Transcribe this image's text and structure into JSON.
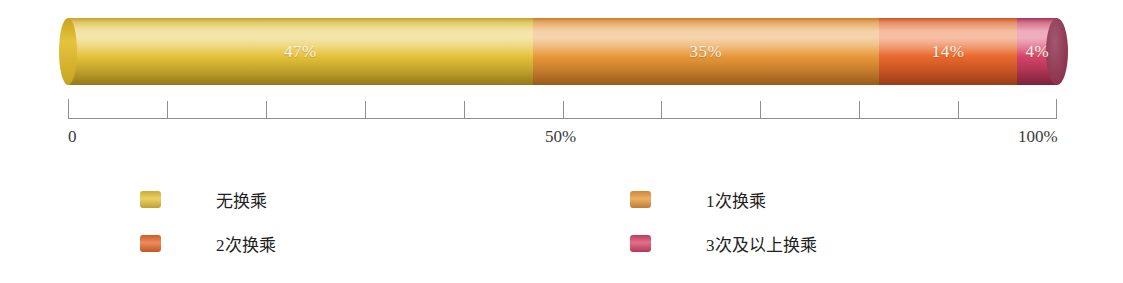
{
  "chart_data": {
    "type": "bar",
    "orientation": "horizontal",
    "stacked": true,
    "title": "",
    "xlabel": "",
    "ylabel": "",
    "xlim": [
      0,
      100
    ],
    "grid": false,
    "legend_position": "bottom",
    "categories": [
      "无换乘",
      "1次换乘",
      "2次换乘",
      "3次及以上换乘"
    ],
    "values": [
      47,
      35,
      14,
      4
    ],
    "data_labels": [
      "47%",
      "35%",
      "14%",
      "4%"
    ],
    "colors": [
      "#E5C33C",
      "#E8993C",
      "#E96A2E",
      "#D8456A"
    ],
    "series": [
      {
        "name": "无换乘",
        "value": 47,
        "label": "47%",
        "color": "#E5C33C"
      },
      {
        "name": "1次换乘",
        "value": 35,
        "label": "35%",
        "color": "#E8993C"
      },
      {
        "name": "2次换乘",
        "value": 14,
        "label": "14%",
        "color": "#E96A2E"
      },
      {
        "name": "3次及以上换乘",
        "value": 4,
        "label": "4%",
        "color": "#D8456A"
      }
    ],
    "axis": {
      "ticks": [
        0,
        10,
        20,
        30,
        40,
        50,
        60,
        70,
        80,
        90,
        100
      ],
      "tick_labels": [
        "0",
        "50%",
        "100%"
      ],
      "labeled_ticks": [
        0,
        50,
        100
      ]
    }
  },
  "bar": {
    "segments": [
      {
        "label": "47%",
        "value": 47,
        "color": "#E5C33C",
        "color_dark": "#C6A423",
        "name": "无换乘"
      },
      {
        "label": "35%",
        "value": 35,
        "color": "#E8993C",
        "color_dark": "#CE7B25",
        "name": "1次换乘"
      },
      {
        "label": "14%",
        "value": 14,
        "color": "#E96A2E",
        "color_dark": "#CE5320",
        "name": "2次换乘"
      },
      {
        "label": "4%",
        "value": 4,
        "color": "#D8456A",
        "color_dark": "#A83050",
        "name": "3次及以上换乘"
      }
    ],
    "end_cap_color": "#8E3350"
  },
  "axis": {
    "start_label": "0",
    "mid_label": "50%",
    "end_label": "100%"
  },
  "legend": {
    "items": [
      {
        "label": "无换乘",
        "color": "#E5C33C"
      },
      {
        "label": "1次换乘",
        "color": "#E8993C"
      },
      {
        "label": "2次换乘",
        "color": "#E96A2E"
      },
      {
        "label": "3次及以上换乘",
        "color": "#D8456A"
      }
    ]
  }
}
